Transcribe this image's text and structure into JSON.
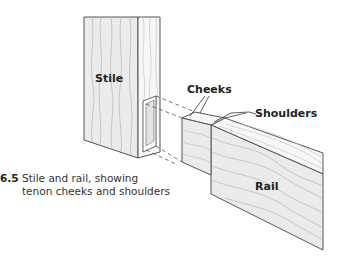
{
  "figure": {
    "number": "6.5",
    "caption_line1": "Stile and rail, showing",
    "caption_line2": "tenon cheeks and shoulders"
  },
  "labels": {
    "stile": "Stile",
    "rail": "Rail",
    "cheeks": "Cheeks",
    "shoulders": "Shoulders"
  },
  "colors": {
    "face_fill": "#ebebeb",
    "side_fill": "#f6f6f6",
    "outline": "#555555",
    "grain": "#b0b0b0"
  }
}
